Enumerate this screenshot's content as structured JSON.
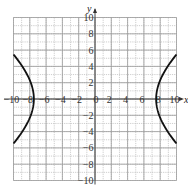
{
  "chart_data": {
    "type": "line",
    "title": "",
    "xlabel": "x",
    "ylabel": "y",
    "xlim": [
      -10,
      10
    ],
    "ylim": [
      -10,
      10
    ],
    "grid": true,
    "grid_step": 1,
    "x_ticks": [
      -10,
      -8,
      -6,
      -4,
      -2,
      0,
      2,
      4,
      6,
      8,
      10
    ],
    "x_tick_labels": [
      "−10",
      "−8",
      "−6",
      "−4",
      "−2",
      "0",
      "2",
      "4",
      "6",
      "8",
      "10"
    ],
    "y_ticks": [
      10,
      8,
      6,
      4,
      2,
      -2,
      -4,
      -6,
      -8,
      -10
    ],
    "y_tick_labels": [
      "10",
      "8",
      "6",
      "4",
      "2",
      "−2",
      "−4",
      "−6",
      "−8",
      "−10"
    ],
    "series": [
      {
        "name": "hyperbola",
        "description": "horizontal hyperbola centered at origin, vertices near (±7.5, 0)",
        "a": 7.5,
        "b": 6.2,
        "right_branch": [
          [
            10,
            -5.5
          ],
          [
            9,
            -4.1
          ],
          [
            8,
            -2.3
          ],
          [
            7.5,
            0
          ],
          [
            8,
            2.3
          ],
          [
            9,
            4.1
          ],
          [
            10,
            5.5
          ]
        ],
        "left_branch": [
          [
            -10,
            -5.5
          ],
          [
            -9,
            -4.1
          ],
          [
            -8,
            -2.3
          ],
          [
            -7.5,
            0
          ],
          [
            -8,
            2.3
          ],
          [
            -9,
            4.1
          ],
          [
            -10,
            5.5
          ]
        ]
      }
    ]
  }
}
